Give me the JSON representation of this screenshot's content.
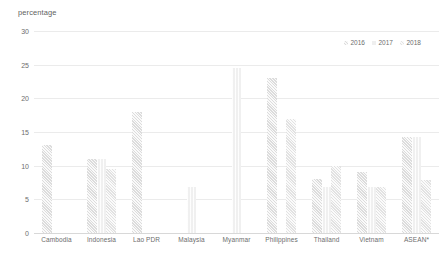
{
  "chart_data": {
    "type": "bar",
    "title": "",
    "subtitle": "",
    "xlabel": "",
    "ylabel": "percentage",
    "ylim": [
      0,
      30
    ],
    "yticks": [
      0,
      5,
      10,
      15,
      20,
      25,
      30
    ],
    "ytick_labels": [
      "0",
      "5",
      "10",
      "15",
      "20",
      "25",
      "30"
    ],
    "grid": true,
    "grid_axis": "y",
    "legend_position": "top-right",
    "categories": [
      "Cambodia",
      "Indonesia",
      "Lao PDR",
      "Malaysia",
      "Myanmar",
      "Philippines",
      "Thailand",
      "Vietnam",
      "ASEAN*"
    ],
    "series": [
      {
        "name": "2016",
        "color": "#dcdcdc",
        "values": [
          13.0,
          11.0,
          18.0,
          null,
          null,
          23.0,
          8.0,
          9.0,
          14.3
        ]
      },
      {
        "name": "2017",
        "color": "#efefef",
        "values": [
          null,
          11.0,
          null,
          6.9,
          24.5,
          null,
          6.9,
          6.9,
          14.3
        ]
      },
      {
        "name": "2018",
        "color": "#e4e4e4",
        "values": [
          null,
          9.5,
          null,
          null,
          null,
          17.0,
          9.9,
          6.9,
          7.8
        ]
      }
    ]
  },
  "axis": {
    "y_title": "percentage"
  },
  "legend": {
    "items": [
      {
        "label": "2016",
        "swatch": "legend-swatch-2016"
      },
      {
        "label": "2017",
        "swatch": "legend-swatch-2017"
      },
      {
        "label": "2018",
        "swatch": "legend-swatch-2018"
      }
    ]
  }
}
